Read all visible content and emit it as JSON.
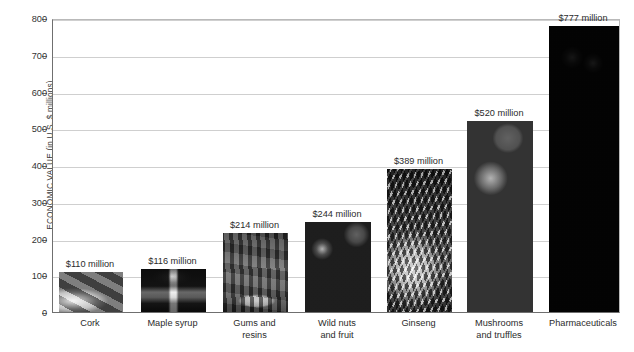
{
  "chart_data": {
    "type": "bar",
    "title": "",
    "xlabel": "",
    "ylabel": "ECONOMIC VALUE (in U.S. $ millions)",
    "ylim": [
      0,
      800
    ],
    "yticks": [
      0,
      100,
      200,
      300,
      400,
      500,
      600,
      700,
      800
    ],
    "ytick_labels": [
      "0",
      "100",
      "200",
      "300",
      "400",
      "500",
      "600",
      "700",
      "800"
    ],
    "grid": "horizontal",
    "legend": "none",
    "categories": [
      "Cork",
      "Maple syrup",
      "Gums and resins",
      "Wild nuts and fruit",
      "Ginseng",
      "Mushrooms and truffles",
      "Pharmaceuticals"
    ],
    "values": [
      110,
      116,
      214,
      244,
      389,
      520,
      777
    ],
    "value_labels": [
      "$110 million",
      "$116 million",
      "$214 million",
      "$244 million",
      "$389 million",
      "$520 million",
      "$777 million"
    ],
    "bars": [
      {
        "category": "Cork",
        "category_lines": [
          "Cork"
        ],
        "value": 110,
        "value_label": "$110 million",
        "fill": "photo-cork",
        "photo_description": "stacked cork bark bundles",
        "tone": "#9a958c"
      },
      {
        "category": "Maple syrup",
        "category_lines": [
          "Maple syrup"
        ],
        "value": 116,
        "value_label": "$116 million",
        "fill": "photo-maple-syrup",
        "photo_description": "syrup pouring from a spile",
        "tone": "#6f6f6f"
      },
      {
        "category": "Gums and resins",
        "category_lines": [
          "Gums and",
          "resins"
        ],
        "value": 214,
        "value_label": "$214 million",
        "fill": "photo-gums-resins",
        "photo_description": "resin collecting bowl on tree trunk",
        "tone": "#6d6459"
      },
      {
        "category": "Wild nuts and fruit",
        "category_lines": [
          "Wild nuts",
          "and fruit"
        ],
        "value": 244,
        "value_label": "$244 million",
        "fill": "photo-wild-nuts-fruit",
        "photo_description": "pile of nuts and fruit",
        "tone": "#7c7469"
      },
      {
        "category": "Ginseng",
        "category_lines": [
          "Ginseng"
        ],
        "value": 389,
        "value_label": "$389 million",
        "fill": "photo-ginseng",
        "photo_description": "ginseng roots",
        "tone": "#8b8577"
      },
      {
        "category": "Mushrooms and truffles",
        "category_lines": [
          "Mushrooms",
          "and truffles"
        ],
        "value": 520,
        "value_label": "$520 million",
        "fill": "photo-mushrooms-truffles",
        "photo_description": "heap of mushrooms and truffles",
        "tone": "#8a8276"
      },
      {
        "category": "Pharmaceuticals",
        "category_lines": [
          "Pharmaceuticals"
        ],
        "value": 777,
        "value_label": "$777 million",
        "fill": "photo-pharmaceuticals",
        "photo_description": "dark berries on a branch",
        "tone": "#3c3b38"
      }
    ]
  },
  "colors": {
    "axis": "#6f6f6f",
    "grid": "#cfcfcf",
    "text": "#2b2b2b",
    "background": "#ffffff"
  }
}
